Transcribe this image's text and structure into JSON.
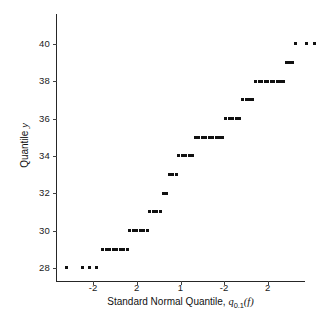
{
  "chart_data": {
    "type": "scatter",
    "title": "",
    "xlabel": "Standard Normal Quantile, q0.1(f)",
    "xlabel_parts": {
      "text": "Standard Normal Quantile, ",
      "symbol": "q",
      "subscript": "0.1",
      "argument": "(f)"
    },
    "ylabel": "Quantile y",
    "ylabel_parts": {
      "text": "Quantile ",
      "symbol": "y"
    },
    "grid": false,
    "legend": "none",
    "xlim": [
      -2.85,
      2.85
    ],
    "ylim": [
      27.3,
      41.6
    ],
    "xticks": [
      -2,
      -1,
      0,
      1,
      2
    ],
    "xtick_labels": [
      "-2",
      "2",
      "1",
      "-2",
      "2"
    ],
    "yticks": [
      28,
      30,
      32,
      34,
      36,
      38,
      40
    ],
    "ytick_labels": [
      "28",
      "30",
      "32",
      "34",
      "36",
      "38",
      "40"
    ],
    "marker": "square",
    "marker_color": "#111111",
    "marker_size_px": 3,
    "points": [
      {
        "x": -2.6,
        "y": 28
      },
      {
        "x": -2.25,
        "y": 28
      },
      {
        "x": -2.08,
        "y": 28
      },
      {
        "x": -1.92,
        "y": 28
      },
      {
        "x": -1.78,
        "y": 29
      },
      {
        "x": -1.7,
        "y": 29
      },
      {
        "x": -1.62,
        "y": 29
      },
      {
        "x": -1.54,
        "y": 29
      },
      {
        "x": -1.46,
        "y": 29
      },
      {
        "x": -1.38,
        "y": 29
      },
      {
        "x": -1.3,
        "y": 29
      },
      {
        "x": -1.22,
        "y": 29
      },
      {
        "x": -1.16,
        "y": 30
      },
      {
        "x": -1.08,
        "y": 30
      },
      {
        "x": -1.0,
        "y": 30
      },
      {
        "x": -0.92,
        "y": 30
      },
      {
        "x": -0.84,
        "y": 30
      },
      {
        "x": -0.76,
        "y": 30
      },
      {
        "x": -0.7,
        "y": 31
      },
      {
        "x": -0.62,
        "y": 31
      },
      {
        "x": -0.54,
        "y": 31
      },
      {
        "x": -0.46,
        "y": 31
      },
      {
        "x": -0.4,
        "y": 32
      },
      {
        "x": -0.32,
        "y": 32
      },
      {
        "x": -0.26,
        "y": 33
      },
      {
        "x": -0.18,
        "y": 33
      },
      {
        "x": -0.1,
        "y": 33
      },
      {
        "x": -0.04,
        "y": 34
      },
      {
        "x": 0.04,
        "y": 34
      },
      {
        "x": 0.12,
        "y": 34
      },
      {
        "x": 0.2,
        "y": 34
      },
      {
        "x": 0.28,
        "y": 34
      },
      {
        "x": 0.34,
        "y": 35
      },
      {
        "x": 0.42,
        "y": 35
      },
      {
        "x": 0.5,
        "y": 35
      },
      {
        "x": 0.58,
        "y": 35
      },
      {
        "x": 0.66,
        "y": 35
      },
      {
        "x": 0.74,
        "y": 35
      },
      {
        "x": 0.82,
        "y": 35
      },
      {
        "x": 0.9,
        "y": 35
      },
      {
        "x": 0.96,
        "y": 35
      },
      {
        "x": 1.04,
        "y": 36
      },
      {
        "x": 1.12,
        "y": 36
      },
      {
        "x": 1.2,
        "y": 36
      },
      {
        "x": 1.28,
        "y": 36
      },
      {
        "x": 1.36,
        "y": 36
      },
      {
        "x": 1.42,
        "y": 37
      },
      {
        "x": 1.5,
        "y": 37
      },
      {
        "x": 1.58,
        "y": 37
      },
      {
        "x": 1.64,
        "y": 37
      },
      {
        "x": 1.72,
        "y": 38
      },
      {
        "x": 1.8,
        "y": 38
      },
      {
        "x": 1.86,
        "y": 38
      },
      {
        "x": 1.94,
        "y": 38
      },
      {
        "x": 2.0,
        "y": 38
      },
      {
        "x": 2.08,
        "y": 38
      },
      {
        "x": 2.14,
        "y": 38
      },
      {
        "x": 2.22,
        "y": 38
      },
      {
        "x": 2.28,
        "y": 38
      },
      {
        "x": 2.36,
        "y": 38
      },
      {
        "x": 2.42,
        "y": 39
      },
      {
        "x": 2.5,
        "y": 39
      },
      {
        "x": 2.56,
        "y": 39
      },
      {
        "x": 2.64,
        "y": 40
      },
      {
        "x": 2.88,
        "y": 40
      },
      {
        "x": 3.06,
        "y": 40
      },
      {
        "x": 3.2,
        "y": 40
      },
      {
        "x": 3.54,
        "y": 41
      }
    ]
  }
}
